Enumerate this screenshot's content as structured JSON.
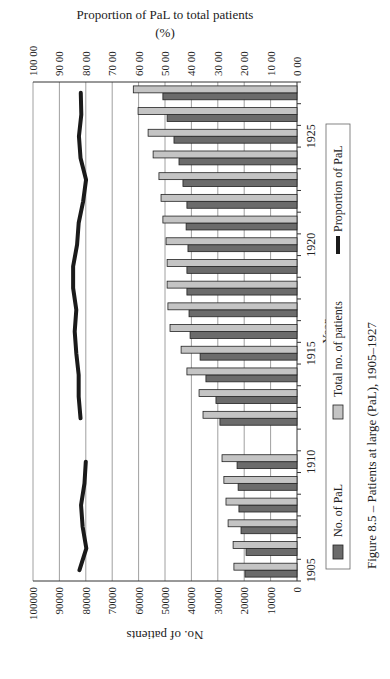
{
  "figure": {
    "caption": "Figure 8.5 – Patients at large (PaL), 1905–1927"
  },
  "legend": {
    "items": [
      {
        "label": "No. of PaL",
        "color": "#6b6b6b",
        "kind": "bar"
      },
      {
        "label": "Total no. of patients",
        "color": "#c4c4c4",
        "kind": "bar"
      },
      {
        "label": "Proportion of PaL",
        "color": "#1a1a1a",
        "kind": "line"
      }
    ]
  },
  "axes": {
    "x_label": "Year",
    "y_left_label": "No. of patients",
    "y_right_label_line1": "Proportion of PaL to total patients",
    "y_right_label_line2": "(%)",
    "y_left_ticks": [
      "0",
      "10000",
      "20000",
      "30000",
      "40000",
      "50000",
      "60000",
      "70000",
      "80000",
      "90000",
      "100000"
    ],
    "y_right_ticks": [
      "0.00",
      "10.00",
      "20.00",
      "30.00",
      "40.00",
      "50.00",
      "60.00",
      "70.00",
      "80.00",
      "90.00",
      "100.00"
    ],
    "x_tick_labels": [
      "1905",
      "1910",
      "1915",
      "1920",
      "1925"
    ]
  },
  "chart_data": {
    "type": "bar",
    "title": "Figure 8.5 – Patients at large (PaL), 1905–1927",
    "xlabel": "Year",
    "ylabel": "No. of patients",
    "ylabel_right": "Proportion of PaL to total patients (%)",
    "ylim": [
      0,
      100000
    ],
    "ylim_right": [
      0,
      100
    ],
    "grid": true,
    "legend_position": "bottom",
    "orientation_note": "figure printed rotated 90 degrees",
    "categories": [
      "1905",
      "1906",
      "1907",
      "1908",
      "1909",
      "1910",
      "1911",
      "1912",
      "1913",
      "1914",
      "1915",
      "1916",
      "1917",
      "1918",
      "1919",
      "1920",
      "1921",
      "1922",
      "1923",
      "1924",
      "1925",
      "1926",
      "1927"
    ],
    "series": [
      {
        "name": "No. of PaL",
        "type": "bar",
        "values": [
          19700,
          19300,
          21200,
          22000,
          22300,
          22700,
          null,
          29200,
          30700,
          34500,
          36700,
          40500,
          40900,
          41700,
          41700,
          41300,
          42000,
          41700,
          43200,
          44700,
          46600,
          49200,
          50800
        ]
      },
      {
        "name": "Total no. of patients",
        "type": "bar",
        "values": [
          23900,
          24200,
          26100,
          26900,
          27700,
          28400,
          null,
          35600,
          37100,
          41700,
          43900,
          48100,
          48900,
          49200,
          49200,
          49600,
          50800,
          51500,
          52300,
          54500,
          56400,
          60200,
          62000
        ]
      },
      {
        "name": "Proportion of PaL",
        "type": "line",
        "axis": "right",
        "values": [
          82.4,
          79.8,
          81.2,
          81.8,
          80.5,
          80.0,
          null,
          82.0,
          82.7,
          82.7,
          83.6,
          84.2,
          83.6,
          84.8,
          84.8,
          83.3,
          82.7,
          81.0,
          79.9,
          82.0,
          82.6,
          81.7,
          81.9
        ]
      }
    ]
  }
}
